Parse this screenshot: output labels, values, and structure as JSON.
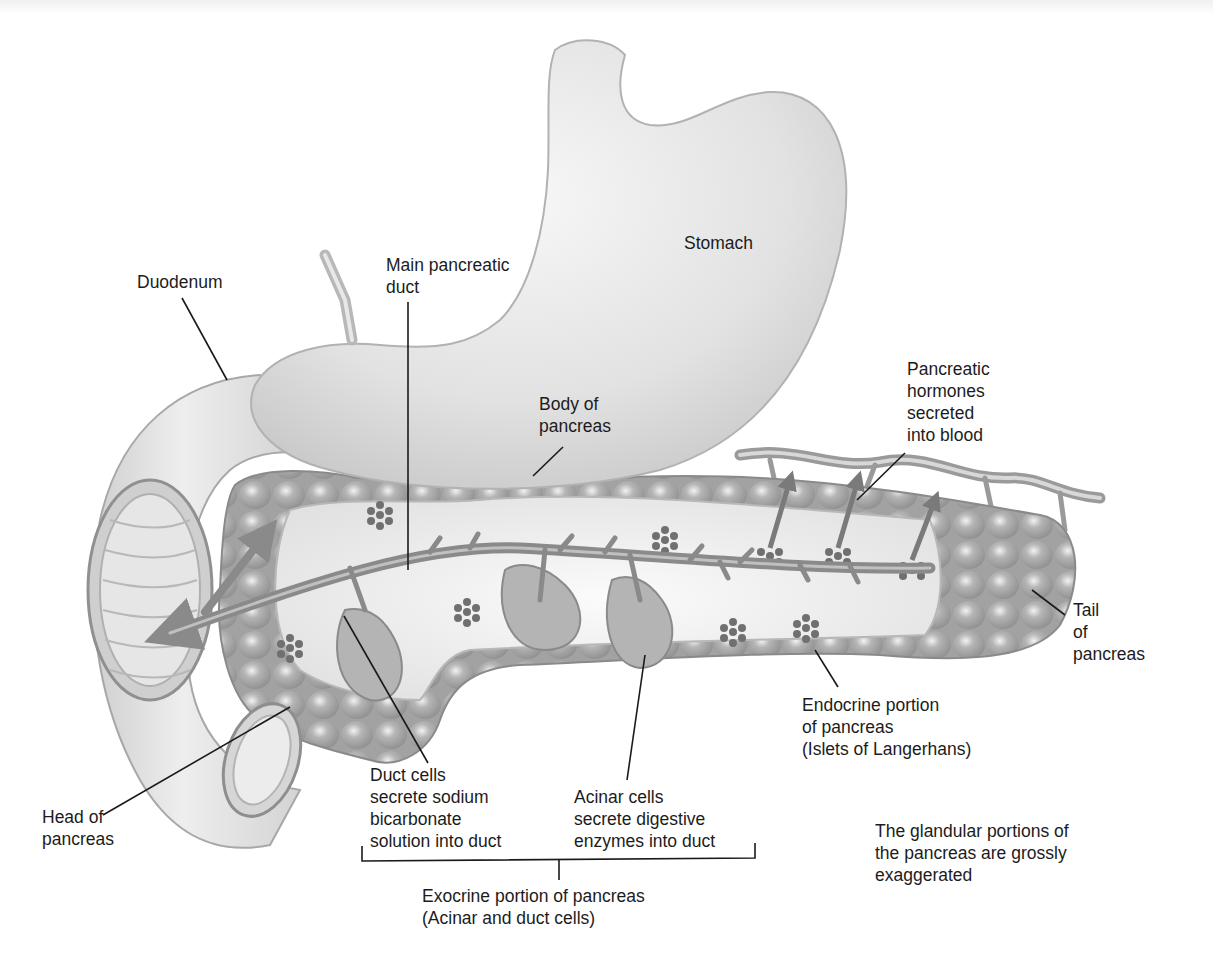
{
  "figure": {
    "colors": {
      "background": "#ffffff",
      "organ_light": "#e4e4e4",
      "organ_mid": "#c9c9c9",
      "gland": "#9c9c9c",
      "duct": "#8a8a8a",
      "islet": "#6e6e6e",
      "text": "#1c1c1c",
      "leader": "#1a1a1a"
    }
  },
  "labels": {
    "stomach": {
      "lines": [
        "Stomach"
      ]
    },
    "duodenum": {
      "lines": [
        "Duodenum"
      ]
    },
    "main_duct": {
      "lines": [
        "Main pancreatic",
        "duct"
      ]
    },
    "body": {
      "lines": [
        "Body of",
        "pancreas"
      ]
    },
    "hormones": {
      "lines": [
        "Pancreatic",
        "hormones",
        "secreted",
        "into blood"
      ]
    },
    "tail": {
      "lines": [
        "Tail",
        "of",
        "pancreas"
      ]
    },
    "endocrine": {
      "lines": [
        "Endocrine portion",
        "of pancreas",
        "(Islets of Langerhans)"
      ]
    },
    "duct_cells": {
      "lines": [
        "Duct cells",
        "secrete sodium",
        "bicarbonate",
        "solution into duct"
      ]
    },
    "acinar_cells": {
      "lines": [
        "Acinar cells",
        "secrete digestive",
        "enzymes into duct"
      ]
    },
    "head": {
      "lines": [
        "Head of",
        "pancreas"
      ]
    },
    "exocrine": {
      "lines": [
        "Exocrine portion of pancreas",
        "(Acinar and duct cells)"
      ]
    },
    "note": {
      "lines": [
        "The glandular portions of",
        "the pancreas are grossly",
        "exaggerated"
      ]
    }
  }
}
